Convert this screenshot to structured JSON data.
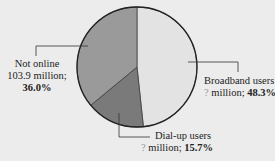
{
  "chart_data": {
    "type": "pie",
    "title": "",
    "slices": [
      {
        "label": "Broadband users",
        "value_text": "? million",
        "percent": 48.3,
        "color": "#e3e3e3"
      },
      {
        "label": "Dial-up users",
        "value_text": "? million",
        "percent": 15.7,
        "color": "#7a7a7a"
      },
      {
        "label": "Not online",
        "value_text": "103.9 million",
        "percent": 36.0,
        "color": "#9a9a9a"
      }
    ]
  },
  "labels": {
    "broadband": {
      "line1": "Broadband users",
      "q": "?",
      "mid": " million; ",
      "pct": "48.3%"
    },
    "dialup": {
      "line1": "Dial-up users",
      "q": "?",
      "mid": " million; ",
      "pct": "15.7%"
    },
    "notonline": {
      "line1": "Not online",
      "line2": "103.9 million;",
      "pct": "36.0%"
    }
  }
}
